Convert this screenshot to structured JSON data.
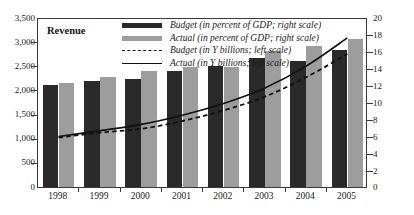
{
  "figure": {
    "cut_title": "",
    "panel_label": "Revenue"
  },
  "legend": {
    "items": [
      {
        "key": "swatch-dark",
        "label": "Budget (in percent of GDP; right scale)"
      },
      {
        "key": "swatch-light",
        "label": "Actual (in percent of GDP; right scale)"
      },
      {
        "key": "line-dashed",
        "label": "Budget (in Y billions; left scale)"
      },
      {
        "key": "line-solid",
        "label": "Actual (in Y billions; left scale)"
      }
    ]
  },
  "chart_data": {
    "type": "bar",
    "title": "Revenue",
    "xlabel": "",
    "ylabel": "",
    "categories": [
      "1998",
      "1999",
      "2000",
      "2001",
      "2002",
      "2003",
      "2004",
      "2005"
    ],
    "left_axis": {
      "label": "Y billions",
      "ylim": [
        0,
        3500
      ],
      "ticks": [
        0,
        500,
        1000,
        1500,
        2000,
        2500,
        3000,
        3500
      ],
      "tick_labels": [
        "0",
        "500",
        "1,000",
        "1,500",
        "2,000",
        "2,500",
        "3,000",
        "3,500"
      ]
    },
    "right_axis": {
      "label": "percent of GDP",
      "ylim": [
        0,
        20
      ],
      "ticks": [
        0,
        2,
        4,
        6,
        8,
        10,
        12,
        14,
        16,
        18,
        20
      ],
      "tick_labels": [
        "0",
        "2",
        "4",
        "6",
        "8",
        "10",
        "12",
        "14",
        "16",
        "18",
        "20"
      ]
    },
    "grid": false,
    "legend_position": "top-center",
    "series": [
      {
        "name": "Budget (in percent of GDP; right scale)",
        "kind": "bar",
        "axis": "right",
        "color": "#2a2a2a",
        "values": [
          12.0,
          12.5,
          12.7,
          13.7,
          14.2,
          15.2,
          14.8,
          16.1
        ]
      },
      {
        "name": "Actual (in percent of GDP; right scale)",
        "kind": "bar",
        "axis": "right",
        "color": "#9d9d9d",
        "values": [
          12.2,
          13.0,
          13.7,
          14.1,
          14.1,
          16.0,
          16.6,
          17.4
        ]
      },
      {
        "name": "Budget (in Y billions; left scale)",
        "kind": "line-dashed",
        "axis": "left",
        "color": "#111111",
        "values": [
          1060,
          1160,
          1240,
          1400,
          1620,
          1900,
          2300,
          2780
        ]
      },
      {
        "name": "Actual (in Y billions; left scale)",
        "kind": "line-solid",
        "axis": "left",
        "color": "#111111",
        "values": [
          1080,
          1200,
          1330,
          1520,
          1760,
          2080,
          2530,
          3110
        ]
      }
    ]
  }
}
